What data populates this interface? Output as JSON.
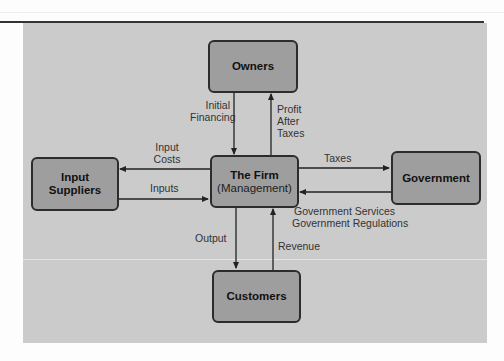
{
  "diagram": {
    "type": "flow",
    "nodes": {
      "owners": {
        "label": "Owners"
      },
      "firm": {
        "label": "The Firm",
        "sublabel": "(Management)"
      },
      "customers": {
        "label": "Customers"
      },
      "input_suppliers": {
        "line1": "Input",
        "line2": "Suppliers"
      },
      "government": {
        "label": "Government"
      }
    },
    "edges": {
      "initial_financing": {
        "from": "Owners",
        "to": "The Firm",
        "line1": "Initial",
        "line2": "Financing"
      },
      "profit_after_taxes": {
        "from": "The Firm",
        "to": "Owners",
        "line1": "Profit",
        "line2": "After",
        "line3": "Taxes"
      },
      "input_costs": {
        "from": "The Firm",
        "to": "Input Suppliers",
        "line1": "Input",
        "line2": "Costs"
      },
      "inputs": {
        "from": "Input Suppliers",
        "to": "The Firm",
        "label": "Inputs"
      },
      "taxes": {
        "from": "The Firm",
        "to": "Government",
        "label": "Taxes"
      },
      "government_services": {
        "from": "Government",
        "to": "The Firm",
        "line1": "Government Services",
        "line2": "Government Regulations"
      },
      "output": {
        "from": "The Firm",
        "to": "Customers",
        "label": "Output"
      },
      "revenue": {
        "from": "Customers",
        "to": "The Firm",
        "label": "Revenue"
      }
    },
    "colors": {
      "panel": "#cbcbcb",
      "box_fill": "#9e9e9e",
      "box_border": "#2c2c2c",
      "arrow": "#222222"
    }
  }
}
